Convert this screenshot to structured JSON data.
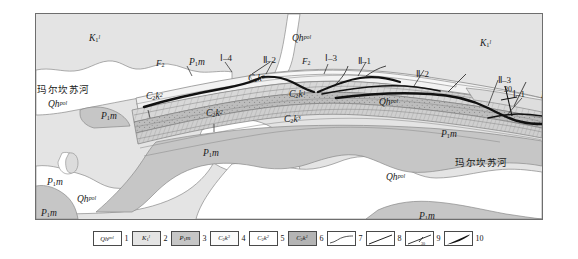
{
  "figure": {
    "type": "geological-structural-map",
    "frame": {
      "x": 35,
      "y": 13,
      "w": 506,
      "h": 205
    }
  },
  "colors": {
    "quaternary_qh": "#ffffff",
    "cretaceous_k1l": "#e4e4e4",
    "permian_p1m": "#c6c6c6",
    "carbon_c2k3": "#f2f2f2",
    "carbon_c2k2": "#d8d8d8",
    "carbon_c2k1": "#b4b4b4",
    "fault_line": "#1a1a1a",
    "thrust_line": "#000000",
    "boundary_line": "#7a7a7a",
    "frame_border": "#6e6e6e",
    "text": "#1a1a1a"
  },
  "map_labels": [
    {
      "id": "k1l-left",
      "kind": "stratum",
      "unit": "K",
      "sub": "1",
      "sup": "l",
      "x": 88,
      "y": 33
    },
    {
      "id": "k1l-right",
      "kind": "stratum",
      "unit": "K",
      "sub": "1",
      "sup": "l",
      "x": 479,
      "y": 38
    },
    {
      "id": "qh-top",
      "kind": "stratum",
      "unit": "Qh",
      "sub": "",
      "sup": "pol",
      "x": 291,
      "y": 33
    },
    {
      "id": "qh-left",
      "kind": "stratum",
      "unit": "Qh",
      "sub": "",
      "sup": "pol",
      "x": 47,
      "y": 99
    },
    {
      "id": "qh-mid",
      "kind": "stratum",
      "unit": "Qh",
      "sub": "",
      "sup": "pol",
      "x": 378,
      "y": 97
    },
    {
      "id": "qh-center",
      "kind": "stratum",
      "unit": "Qh",
      "sub": "",
      "sup": "pol",
      "x": 385,
      "y": 172
    },
    {
      "id": "qh-lowleft",
      "kind": "stratum",
      "unit": "Qh",
      "sub": "",
      "sup": "pol",
      "x": 76,
      "y": 194
    },
    {
      "id": "p1m-a",
      "kind": "stratum",
      "unit": "P",
      "sub": "1",
      "sup": "",
      "x": 100,
      "y": 111,
      "italic_tail": "m"
    },
    {
      "id": "p1m-b",
      "kind": "stratum",
      "unit": "P",
      "sub": "1",
      "sup": "",
      "x": 202,
      "y": 148,
      "italic_tail": "m"
    },
    {
      "id": "p1m-c",
      "kind": "stratum",
      "unit": "P",
      "sub": "1",
      "sup": "",
      "x": 440,
      "y": 129,
      "italic_tail": "m"
    },
    {
      "id": "p1m-d",
      "kind": "stratum",
      "unit": "P",
      "sub": "1",
      "sup": "",
      "x": 46,
      "y": 177,
      "italic_tail": "m"
    },
    {
      "id": "p1m-e",
      "kind": "stratum",
      "unit": "P",
      "sub": "1",
      "sup": "",
      "x": 40,
      "y": 208,
      "italic_tail": "m"
    },
    {
      "id": "p1m-f",
      "kind": "stratum",
      "unit": "P",
      "sub": "1",
      "sup": "",
      "x": 418,
      "y": 211,
      "italic_tail": "m"
    },
    {
      "id": "p1m-g",
      "kind": "stratum",
      "unit": "P",
      "sub": "1",
      "sup": "",
      "x": 188,
      "y": 57,
      "italic_tail": "m"
    },
    {
      "id": "p1m-h",
      "kind": "stratum",
      "unit": "P",
      "sub": "1",
      "sup": "",
      "x": 540,
      "y": 90,
      "italic_tail": "m"
    },
    {
      "id": "c2k2-a",
      "kind": "stratum",
      "unit": "C",
      "sub": "2",
      "sup": "2",
      "x": 145,
      "y": 91,
      "italic_mid": "k"
    },
    {
      "id": "c2k2-b",
      "kind": "stratum",
      "unit": "C",
      "sub": "2",
      "sup": "2",
      "x": 205,
      "y": 108,
      "italic_mid": "k"
    },
    {
      "id": "c2k3-a",
      "kind": "stratum",
      "unit": "C",
      "sub": "2",
      "sup": "3",
      "x": 247,
      "y": 73,
      "italic_mid": "k"
    },
    {
      "id": "c2k3-b",
      "kind": "stratum",
      "unit": "C",
      "sub": "2",
      "sup": "3",
      "x": 283,
      "y": 114,
      "italic_mid": "k"
    },
    {
      "id": "c2k1-a",
      "kind": "stratum",
      "unit": "C",
      "sub": "2",
      "sup": "1",
      "x": 288,
      "y": 89,
      "italic_mid": "k"
    }
  ],
  "fault_labels": [
    {
      "id": "f2-left",
      "text": "F",
      "sub": "2",
      "x": 155,
      "y": 58
    },
    {
      "id": "f2-right",
      "text": "F",
      "sub": "2",
      "x": 301,
      "y": 56
    },
    {
      "id": "i-4",
      "text": "Ⅰ–4",
      "x": 219,
      "y": 53
    },
    {
      "id": "i-3",
      "text": "Ⅰ–3",
      "x": 324,
      "y": 53
    },
    {
      "id": "i-1",
      "text": "Ⅰ–1",
      "x": 512,
      "y": 88
    },
    {
      "id": "ii-2a",
      "text": "Ⅱ–2",
      "x": 262,
      "y": 55
    },
    {
      "id": "ii-1",
      "text": "Ⅱ–1",
      "x": 357,
      "y": 56
    },
    {
      "id": "ii-2b",
      "text": "Ⅱ–2",
      "x": 415,
      "y": 69
    },
    {
      "id": "ii-3",
      "text": "Ⅱ–3",
      "x": 497,
      "y": 75
    }
  ],
  "dip_symbols": [
    {
      "id": "dip-30",
      "angle": "30",
      "x": 505,
      "y": 87
    }
  ],
  "river_labels": [
    {
      "id": "river-left",
      "text": "玛尔坎苏河",
      "x": 33,
      "y": 84
    },
    {
      "id": "river-right",
      "text": "玛尔坎苏河",
      "x": 454,
      "y": 157
    }
  ],
  "legend": {
    "items": [
      {
        "n": "1",
        "type": "swatch",
        "unit": "Qh",
        "sub": "",
        "sup": "pol",
        "fill": "#ffffff"
      },
      {
        "n": "2",
        "type": "swatch",
        "unit": "K",
        "sub": "1",
        "sup": "l",
        "fill": "#e4e4e4"
      },
      {
        "n": "3",
        "type": "swatch",
        "unit": "P",
        "sub": "1",
        "sup": "",
        "tail": "m",
        "fill": "#c6c6c6"
      },
      {
        "n": "4",
        "type": "swatch",
        "unit": "C",
        "sub": "2",
        "sup": "3",
        "mid": "k",
        "fill": "#fafafa"
      },
      {
        "n": "5",
        "type": "swatch",
        "unit": "C",
        "sub": "2",
        "sup": "2",
        "mid": "k",
        "fill": "#ffffff"
      },
      {
        "n": "6",
        "type": "swatch",
        "unit": "C",
        "sub": "2",
        "sup": "1",
        "mid": "k",
        "fill": "#b4b4b4"
      },
      {
        "n": "7",
        "type": "sym",
        "sym": "geologic-boundary"
      },
      {
        "n": "8",
        "type": "sym",
        "sym": "fault-line"
      },
      {
        "n": "9",
        "type": "sym",
        "sym": "bedding-attitude"
      },
      {
        "n": "10",
        "type": "sym",
        "sym": "thrust-fault"
      }
    ]
  }
}
